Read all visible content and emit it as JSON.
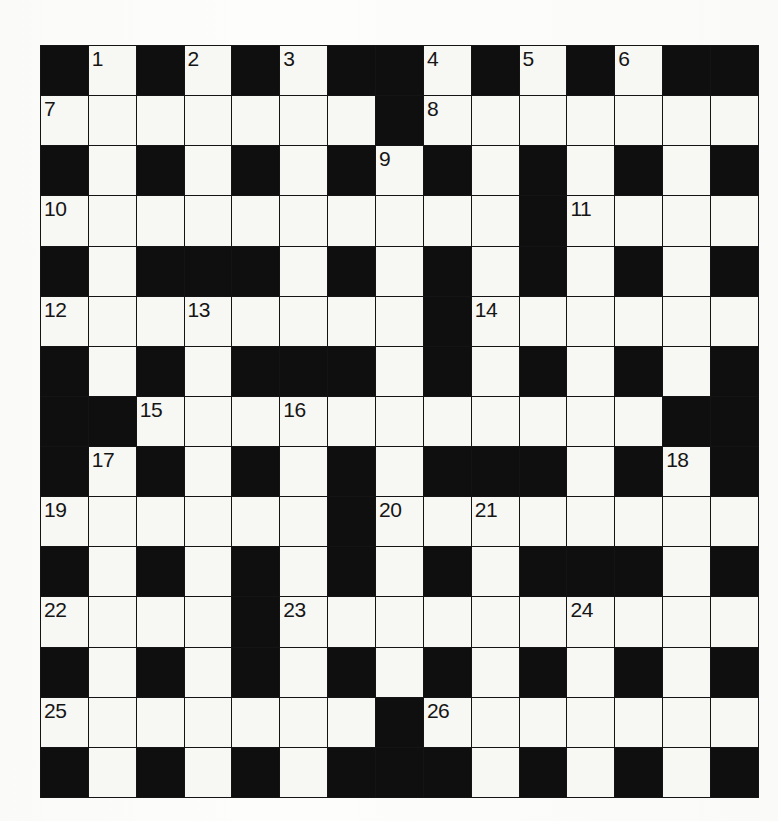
{
  "puzzle": {
    "title": "Crossword Grid",
    "type": "crossword",
    "rows": 15,
    "cols": 15,
    "cell_size_px": 47,
    "colors": {
      "block": "#0f0f0f",
      "cell": "#f7f7f4",
      "grid_line": "#141414",
      "number_text": "#151515",
      "page_background": "#fdfdfb"
    },
    "grid": [
      [
        "black",
        "white",
        "black",
        "white",
        "black",
        "white",
        "black",
        "black",
        "white",
        "black",
        "white",
        "black",
        "white",
        "black",
        "black"
      ],
      [
        "white",
        "white",
        "white",
        "white",
        "white",
        "white",
        "white",
        "black",
        "white",
        "white",
        "white",
        "white",
        "white",
        "white",
        "white"
      ],
      [
        "black",
        "white",
        "black",
        "white",
        "black",
        "white",
        "black",
        "white",
        "black",
        "white",
        "black",
        "white",
        "black",
        "white",
        "black"
      ],
      [
        "white",
        "white",
        "white",
        "white",
        "white",
        "white",
        "white",
        "white",
        "white",
        "white",
        "black",
        "white",
        "white",
        "white",
        "white"
      ],
      [
        "black",
        "white",
        "black",
        "black",
        "black",
        "white",
        "black",
        "white",
        "black",
        "white",
        "black",
        "white",
        "black",
        "white",
        "black"
      ],
      [
        "white",
        "white",
        "white",
        "white",
        "white",
        "white",
        "white",
        "white",
        "black",
        "white",
        "white",
        "white",
        "white",
        "white",
        "white"
      ],
      [
        "black",
        "white",
        "black",
        "white",
        "black",
        "black",
        "black",
        "white",
        "black",
        "white",
        "black",
        "white",
        "black",
        "white",
        "black"
      ],
      [
        "black",
        "black",
        "white",
        "white",
        "white",
        "white",
        "white",
        "white",
        "white",
        "white",
        "white",
        "white",
        "white",
        "black",
        "black"
      ],
      [
        "black",
        "white",
        "black",
        "white",
        "black",
        "white",
        "black",
        "white",
        "black",
        "black",
        "black",
        "white",
        "black",
        "white",
        "black"
      ],
      [
        "white",
        "white",
        "white",
        "white",
        "white",
        "white",
        "black",
        "white",
        "white",
        "white",
        "white",
        "white",
        "white",
        "white",
        "white"
      ],
      [
        "black",
        "white",
        "black",
        "white",
        "black",
        "white",
        "black",
        "white",
        "black",
        "white",
        "black",
        "black",
        "black",
        "white",
        "black"
      ],
      [
        "white",
        "white",
        "white",
        "white",
        "black",
        "white",
        "white",
        "white",
        "white",
        "white",
        "white",
        "white",
        "white",
        "white",
        "white"
      ],
      [
        "black",
        "white",
        "black",
        "white",
        "black",
        "white",
        "black",
        "white",
        "black",
        "white",
        "black",
        "white",
        "black",
        "white",
        "black"
      ],
      [
        "white",
        "white",
        "white",
        "white",
        "white",
        "white",
        "white",
        "black",
        "white",
        "white",
        "white",
        "white",
        "white",
        "white",
        "white"
      ],
      [
        "black",
        "white",
        "black",
        "white",
        "black",
        "white",
        "black",
        "black",
        "black",
        "white",
        "black",
        "white",
        "black",
        "white",
        "black"
      ]
    ],
    "numbers": [
      {
        "n": "1",
        "row": 1,
        "col": 2
      },
      {
        "n": "2",
        "row": 1,
        "col": 4
      },
      {
        "n": "3",
        "row": 1,
        "col": 6
      },
      {
        "n": "4",
        "row": 1,
        "col": 9
      },
      {
        "n": "5",
        "row": 1,
        "col": 11
      },
      {
        "n": "6",
        "row": 1,
        "col": 13
      },
      {
        "n": "7",
        "row": 2,
        "col": 1
      },
      {
        "n": "8",
        "row": 2,
        "col": 9
      },
      {
        "n": "9",
        "row": 3,
        "col": 8
      },
      {
        "n": "10",
        "row": 4,
        "col": 1
      },
      {
        "n": "11",
        "row": 4,
        "col": 12
      },
      {
        "n": "12",
        "row": 6,
        "col": 1
      },
      {
        "n": "13",
        "row": 6,
        "col": 4
      },
      {
        "n": "14",
        "row": 6,
        "col": 10
      },
      {
        "n": "15",
        "row": 8,
        "col": 3
      },
      {
        "n": "16",
        "row": 8,
        "col": 6
      },
      {
        "n": "17",
        "row": 9,
        "col": 2
      },
      {
        "n": "18",
        "row": 9,
        "col": 14
      },
      {
        "n": "19",
        "row": 10,
        "col": 1
      },
      {
        "n": "20",
        "row": 10,
        "col": 8
      },
      {
        "n": "21",
        "row": 10,
        "col": 10
      },
      {
        "n": "22",
        "row": 12,
        "col": 1
      },
      {
        "n": "23",
        "row": 12,
        "col": 6
      },
      {
        "n": "24",
        "row": 12,
        "col": 12
      },
      {
        "n": "25",
        "row": 14,
        "col": 1
      },
      {
        "n": "26",
        "row": 14,
        "col": 9
      }
    ]
  }
}
